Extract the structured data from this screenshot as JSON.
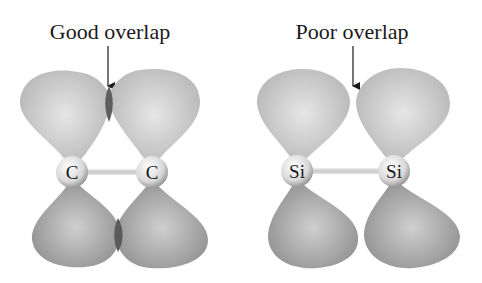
{
  "diagram": {
    "panels": [
      {
        "id": "carbon",
        "caption": "Good overlap",
        "atoms": [
          "C",
          "C"
        ],
        "overlap": "good"
      },
      {
        "id": "silicon",
        "caption": "Poor overlap",
        "atoms": [
          "Si",
          "Si"
        ],
        "overlap": "poor"
      }
    ],
    "colors": {
      "lobe_top": "#c4c4c4",
      "lobe_bottom": "#9a9a9a",
      "overlap": "#5a5a5a",
      "atom": "#e8e8e8",
      "bond": "#cfcfcf",
      "text": "#1a1a1a"
    }
  }
}
